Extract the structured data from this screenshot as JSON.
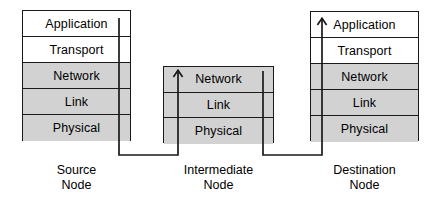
{
  "diagram": {
    "colors": {
      "shaded_layer": "#d2d2d2",
      "plain_layer": "#ffffff",
      "stroke": "#1a1a1a",
      "background": "#ffffff"
    },
    "nodes": [
      {
        "id": "source",
        "caption_line1": "Source",
        "caption_line2": "Node",
        "layers": [
          {
            "label": "Application",
            "fill": "plain"
          },
          {
            "label": "Transport",
            "fill": "plain"
          },
          {
            "label": "Network",
            "fill": "shaded"
          },
          {
            "label": "Link",
            "fill": "shaded"
          },
          {
            "label": "Physical",
            "fill": "shaded"
          }
        ]
      },
      {
        "id": "intermediate",
        "caption_line1": "Intermediate",
        "caption_line2": "Node",
        "layers": [
          {
            "label": "Network",
            "fill": "shaded"
          },
          {
            "label": "Link",
            "fill": "shaded"
          },
          {
            "label": "Physical",
            "fill": "shaded"
          }
        ]
      },
      {
        "id": "destination",
        "caption_line1": "Destination",
        "caption_line2": "Node",
        "layers": [
          {
            "label": "Application",
            "fill": "plain"
          },
          {
            "label": "Transport",
            "fill": "plain"
          },
          {
            "label": "Network",
            "fill": "shaded"
          },
          {
            "label": "Link",
            "fill": "shaded"
          },
          {
            "label": "Physical",
            "fill": "shaded"
          }
        ]
      }
    ],
    "paths": [
      {
        "id": "source-descend",
        "description": "Line descending from Application layer of source node down through the stack and out the bottom",
        "arrowhead": "none"
      },
      {
        "id": "source-to-intermediate",
        "description": "Connector from source node bottom rising into intermediate Network layer",
        "arrowhead": "up"
      },
      {
        "id": "intermediate-descend",
        "description": "Line descending from intermediate Network layer out the bottom of the intermediate stack",
        "arrowhead": "none"
      },
      {
        "id": "intermediate-to-destination",
        "description": "Connector from intermediate node bottom rising into destination Application layer",
        "arrowhead": "up"
      }
    ]
  }
}
